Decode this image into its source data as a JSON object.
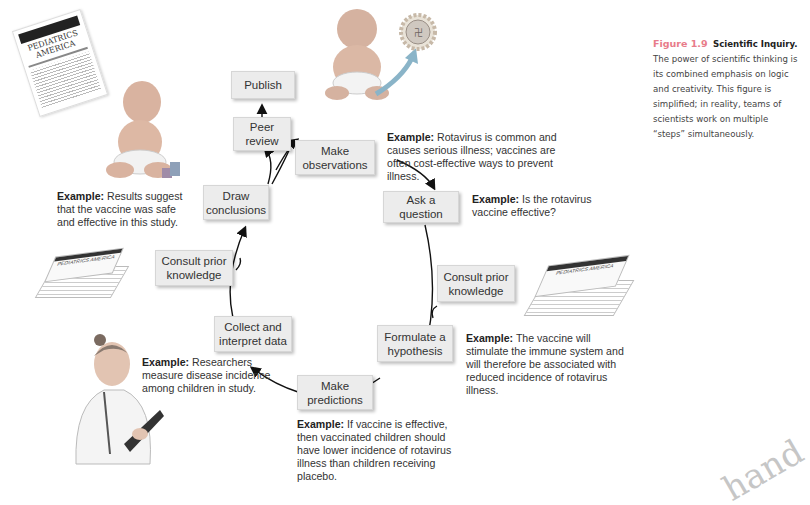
{
  "caption": {
    "figure_label": "Figure 1.9",
    "title": "Scientific Inquiry.",
    "body": "The power of scientific thinking is its combined emphasis on logic and creativity. This figure is simplified; in reality, teams of scientists work on multiple “steps” simultaneously."
  },
  "steps": {
    "publish": "Publish",
    "peer_review": "Peer review",
    "make_observations": "Make observations",
    "ask_question": "Ask a question",
    "consult_prior_right": "Consult prior knowledge",
    "formulate_hypothesis": "Formulate a hypothesis",
    "make_predictions": "Make predictions",
    "collect_interpret": "Collect and interpret data",
    "consult_prior_left": "Consult prior knowledge",
    "draw_conclusions": "Draw conclusions"
  },
  "examples": {
    "label": "Example:",
    "observations": "Rotavirus is common and causes serious illness; vaccines are often cost-effective ways to prevent illness.",
    "question": "Is the rotavirus vaccine effective?",
    "hypothesis": "The vaccine will stimulate the immune system and will therefore be associated with reduced incidence of rotavirus illness.",
    "predictions": "If vaccine is effective, then vaccinated children should have lower incidence of rotavirus illness than children receiving placebo.",
    "data": "Researchers measure disease incidence among children in study.",
    "conclusions": "Results suggest that the vaccine was safe and effective in this study."
  },
  "illustrations": {
    "journal_title_line1": "PEDIATRICS",
    "journal_title_line2": "AMERICA",
    "stack_title": "PEDIATRICS AMERICA",
    "corner_text": "hand"
  }
}
